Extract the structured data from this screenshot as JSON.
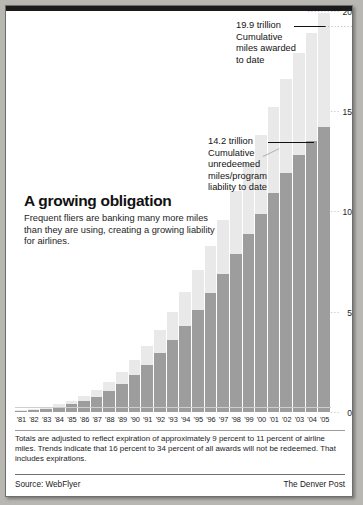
{
  "chart_data": {
    "type": "bar",
    "title": "A growing obligation",
    "subtitle": "Frequent fliers are banking many more miles than they are using, creating a growing liability for airlines.",
    "xlabel": "",
    "ylabel": "",
    "ylim": [
      0,
      20
    ],
    "yticks": [
      0,
      5,
      10,
      15,
      20
    ],
    "ytick_labels": [
      "0",
      "5",
      "10",
      "15",
      "20"
    ],
    "grid": false,
    "legend_position": "none",
    "units": "trillions of miles",
    "categories": [
      "'81",
      "'82",
      "'83",
      "'84",
      "'85",
      "'86",
      "'87",
      "'88",
      "'89",
      "'90",
      "'91",
      "'92",
      "'93",
      "'94",
      "'95",
      "'96",
      "'97",
      "'98",
      "'99",
      "'00",
      "'01",
      "'02",
      "'03",
      "'04",
      "'05"
    ],
    "series": [
      {
        "name": "Cumulative miles awarded to date",
        "color": "#e9e9e9",
        "values": [
          0.08,
          0.15,
          0.25,
          0.38,
          0.55,
          0.8,
          1.1,
          1.5,
          2.0,
          2.6,
          3.3,
          4.1,
          5.0,
          6.0,
          7.1,
          8.3,
          9.6,
          11.0,
          12.4,
          13.8,
          15.2,
          16.6,
          17.9,
          18.9,
          19.9
        ]
      },
      {
        "name": "Cumulative unredeemed miles/program liability to date",
        "color": "#9d9d9d",
        "values": [
          0.05,
          0.1,
          0.17,
          0.26,
          0.38,
          0.55,
          0.76,
          1.05,
          1.4,
          1.85,
          2.35,
          2.95,
          3.6,
          4.3,
          5.1,
          5.95,
          6.9,
          7.9,
          8.9,
          9.9,
          10.9,
          11.9,
          12.8,
          13.5,
          14.2
        ]
      }
    ],
    "annotations": [
      {
        "name": "top-callout",
        "value": "19.9 trillion",
        "label": "19.9 trillion",
        "lines": [
          "19.9 trillion",
          "Cumulative",
          "miles awarded",
          "to date"
        ]
      },
      {
        "name": "mid-callout",
        "value": "14.2 trillion",
        "label": "14.2 trillion",
        "lines": [
          "14.2 trillion",
          "Cumulative",
          "unredeemed",
          "miles/program",
          "liability to date"
        ]
      }
    ]
  },
  "headline": {
    "title": "A growing obligation",
    "subtitle": "Frequent fliers are banking many more miles than they are using, creating a growing liability for airlines."
  },
  "callout_top": {
    "line1": "19.9 trillion",
    "line2": "Cumulative",
    "line3": "miles awarded",
    "line4": "to date",
    "dots": "·········"
  },
  "callout_mid": {
    "line1": "14.2 trillion",
    "line2": "Cumulative",
    "line3": "unredeemed",
    "line4": "miles/program",
    "line5": "liability to date"
  },
  "footnote": {
    "text": "Totals are adjusted to reflect expiration of approximately 9 percent to 11 percent of airline miles. Trends indicate that 16 percent to 34 percent of all awards will not be redeemed. That includes expirations."
  },
  "source": {
    "left": "Source: WebFlyer",
    "right": "The Denver Post"
  },
  "colors": {
    "bar_light": "#e9e9e9",
    "bar_dark": "#9d9d9d",
    "paper": "#ffffff",
    "rule": "#1a1a1a",
    "text": "#141414"
  }
}
